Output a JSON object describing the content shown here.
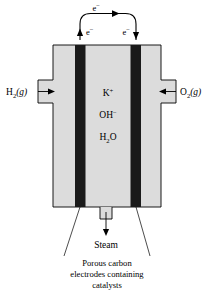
{
  "figure": {
    "colors": {
      "cell_fill": "#dcdcdc",
      "electrode_fill": "#1a1a1a",
      "outline": "#000000",
      "background": "#ffffff"
    }
  },
  "circuit": {
    "electron_top_label": "e−",
    "electron_left_label": "e−",
    "electron_right_label": "e−",
    "electron_symbol_base": "e",
    "electron_charge": "−"
  },
  "inlets": {
    "left": {
      "formula_base": "H",
      "formula_sub": "2",
      "phase": "(g)",
      "label": "H2(g)",
      "arrow_direction": "right"
    },
    "right": {
      "formula_base": "O",
      "formula_sub": "2",
      "phase": "(g)",
      "label": "O2(g)",
      "arrow_direction": "left"
    }
  },
  "electrolyte": {
    "species": [
      {
        "base": "K",
        "sup": "+",
        "sub": "",
        "label": "K+"
      },
      {
        "base": "OH",
        "sup": "−",
        "sub": "",
        "label": "OH−"
      },
      {
        "base": "H",
        "sub": "2",
        "tail": "O",
        "label": "H2O"
      }
    ]
  },
  "outlet": {
    "label": "Steam",
    "arrow_direction": "down"
  },
  "caption": {
    "line1": "Porous carbon",
    "line2": "electrodes containing",
    "line3": "catalysts"
  }
}
